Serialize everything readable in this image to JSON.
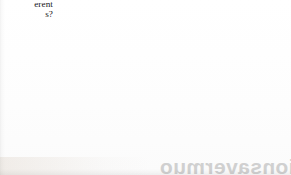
{
  "document": {
    "kind": "scanned-book-page-fragment",
    "page_background": "#ffffff"
  },
  "margin_text": {
    "line1": "erent",
    "line2": "s?",
    "note_color": "#16161a"
  },
  "venn": {
    "title": "two-set-venn-diagram",
    "left_circle": {
      "label": "left-set",
      "cx": 88,
      "cy": 79,
      "r": 84,
      "fill": "#f1f1f1",
      "stroke": "#585858"
    },
    "right_circle": {
      "label": "right-set",
      "cx": 200,
      "cy": 82,
      "r": 85,
      "fill": "#d9d9d9",
      "stroke": "#585858"
    },
    "intersection": {
      "label": "overlap-lens",
      "fill": "#cdcdcd"
    },
    "stroke_width": 0.9
  },
  "bleed_through": {
    "text": "tionsavermuo",
    "color": "#c9c9c9"
  }
}
